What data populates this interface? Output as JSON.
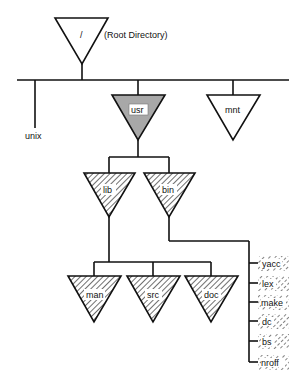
{
  "diagram": {
    "root": {
      "label": "/",
      "annotation": "(Root Directory)"
    },
    "root_children": [
      {
        "label": "unix",
        "kind": "file"
      },
      {
        "label": "usr",
        "kind": "directory",
        "style": "shaded"
      },
      {
        "label": "mnt",
        "kind": "directory",
        "style": "plain"
      }
    ],
    "usr_children": [
      {
        "label": "lib",
        "kind": "directory",
        "style": "hatched"
      },
      {
        "label": "bin",
        "kind": "directory",
        "style": "hatched"
      }
    ],
    "lib_children": [
      {
        "label": "man",
        "kind": "directory",
        "style": "hatched"
      },
      {
        "label": "src",
        "kind": "directory",
        "style": "hatched"
      },
      {
        "label": "doc",
        "kind": "directory",
        "style": "hatched"
      }
    ],
    "bin_files": [
      {
        "label": "yacc"
      },
      {
        "label": "lex"
      },
      {
        "label": "make"
      },
      {
        "label": "dc"
      },
      {
        "label": "bs"
      },
      {
        "label": "nroff"
      }
    ]
  },
  "colors": {
    "line": "#111111",
    "shade": "#a8a8a8",
    "background": "#ffffff"
  }
}
